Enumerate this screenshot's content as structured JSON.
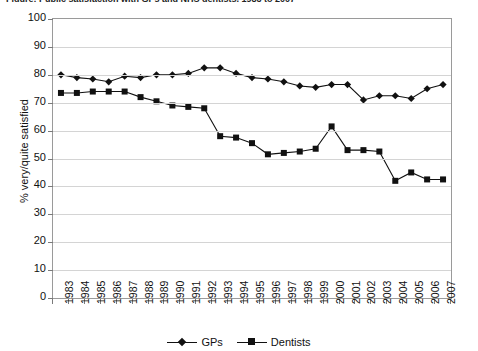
{
  "chart_data": {
    "type": "line",
    "title": "Figure: Public satisfaction with GPs and NHS dentists, 1983 to 2007",
    "xlabel": "",
    "ylabel": "% very/quite satisfied",
    "ylim": [
      0,
      100
    ],
    "ytick_step": 10,
    "yticks": [
      0,
      10,
      20,
      30,
      40,
      50,
      60,
      70,
      80,
      90,
      100
    ],
    "grid": true,
    "legend_position": "bottom",
    "categories": [
      "1983",
      "1984",
      "1985",
      "1986",
      "1987",
      "1988",
      "1989",
      "1990",
      "1991",
      "1992",
      "1993",
      "1994",
      "1995",
      "1996",
      "1997",
      "1998",
      "1999",
      "2000",
      "2001",
      "2002",
      "2003",
      "2004",
      "2005",
      "2006",
      "2007"
    ],
    "series": [
      {
        "name": "GPs",
        "marker": "diamond",
        "color": "#111111",
        "values": [
          80,
          79,
          78.5,
          77.5,
          79.5,
          79,
          80,
          80,
          80.5,
          82.5,
          82.5,
          80.5,
          79,
          78.5,
          77.5,
          76,
          75.5,
          76.5,
          76.5,
          71,
          72.5,
          72.5,
          71.5,
          75,
          76.5
        ]
      },
      {
        "name": "Dentists",
        "marker": "square",
        "color": "#111111",
        "values": [
          73.5,
          73.5,
          74,
          74,
          74,
          72,
          70.5,
          69,
          68.5,
          68,
          58,
          57.5,
          55.5,
          51.5,
          52,
          52.5,
          53.5,
          61.5,
          53,
          53,
          52.5,
          42,
          45,
          42.5,
          42.5
        ]
      }
    ]
  },
  "legend": {
    "entries": [
      {
        "label": "GPs",
        "marker": "diamond"
      },
      {
        "label": "Dentists",
        "marker": "square"
      }
    ]
  }
}
